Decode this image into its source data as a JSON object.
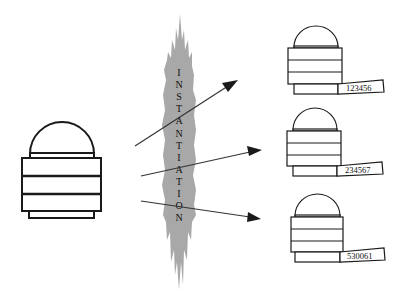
{
  "diagram": {
    "burst": {
      "label": "INSTANTIATION",
      "color": "#a8a8a8"
    },
    "source": {
      "name": "class-object"
    },
    "instances": [
      {
        "id_label": "123456"
      },
      {
        "id_label": "234567"
      },
      {
        "id_label": "530061"
      }
    ],
    "arrows": [
      {
        "from": "source",
        "to": "instance-1"
      },
      {
        "from": "source",
        "to": "instance-2"
      },
      {
        "from": "source",
        "to": "instance-3"
      }
    ]
  }
}
